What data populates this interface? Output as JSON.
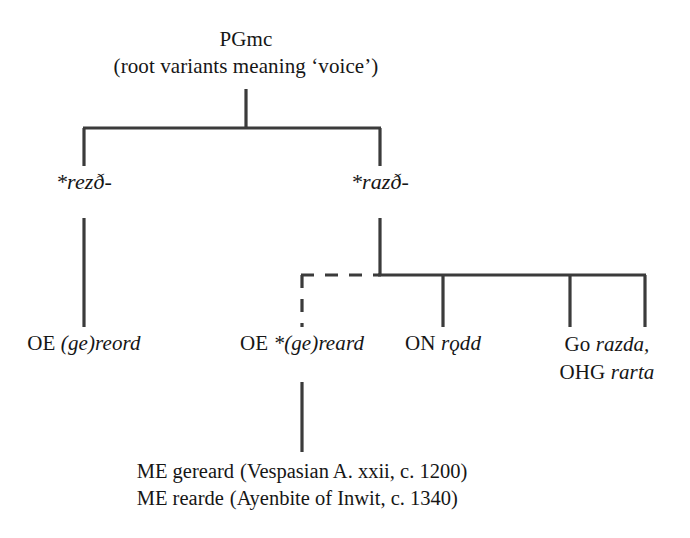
{
  "diagram": {
    "type": "etymological-tree",
    "title_text": "PGmc",
    "background_color": "#ffffff",
    "line_color": "#3b3b3b",
    "text_color": "#161616"
  },
  "root": {
    "label": "PGmc",
    "gloss": "(root variants meaning ‘voice’)"
  },
  "branches": {
    "left": {
      "label": "*rezð-",
      "label_prefix": "*",
      "label_italic": "rezð-"
    },
    "right": {
      "label": "*razð-",
      "label_prefix": "*",
      "label_italic": "razð-"
    }
  },
  "leaves": [
    {
      "id": "oe-gereord",
      "language": "OE",
      "form": "(ge)reord",
      "parent": "*rezð-",
      "link_style": "solid"
    },
    {
      "id": "oe-gereard",
      "language": "OE",
      "form": "*(ge)reard",
      "form_prefix": "*",
      "parent": "*razð-",
      "link_style": "dashed"
    },
    {
      "id": "on-rodd",
      "language": "ON",
      "form": "rǫdd",
      "parent": "*razð-",
      "link_style": "solid"
    },
    {
      "id": "go-ohg",
      "language_1": "Go",
      "form_1": "razda,",
      "language_2": "OHG",
      "form_2": "rarta",
      "parent": "*razð-",
      "link_style": "solid"
    }
  ],
  "descendants": {
    "parent": "OE *(ge)reard",
    "items": [
      {
        "language": "ME",
        "form": "gereard",
        "source_open": "(Vespasian A. xxii,",
        "circa": "c.",
        "year": "1200)",
        "source_italic": false
      },
      {
        "language": "ME",
        "form": "rearde",
        "source_open": "(Ayenbite of Inwit,",
        "circa": "c.",
        "year": "1340)",
        "source_italic": true
      }
    ]
  }
}
